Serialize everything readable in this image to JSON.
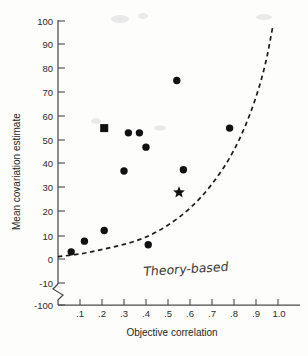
{
  "chart_data": {
    "type": "scatter",
    "title": "",
    "xlabel": "Objective correlation",
    "ylabel": "Mean covariation estimate",
    "xlim": [
      0.0,
      1.0
    ],
    "ylim": [
      -100,
      100
    ],
    "y_axis_break": true,
    "y_break_between": [
      -10,
      -100
    ],
    "grid": false,
    "legend": false,
    "xticks": [
      0.1,
      0.2,
      0.3,
      0.4,
      0.5,
      0.6,
      0.7,
      0.8,
      0.9,
      1.0
    ],
    "xticklabels": [
      ".1",
      ".2",
      ".3",
      ".4",
      ".5",
      ".6",
      ".7",
      ".8",
      ".9",
      "1.0"
    ],
    "yticks": [
      100,
      90,
      80,
      70,
      60,
      50,
      40,
      30,
      20,
      10,
      0,
      -10,
      -100
    ],
    "yticklabels": [
      "100",
      "90",
      "80",
      "70",
      "60",
      "50",
      "40",
      "30",
      "20",
      "10",
      "0",
      "-10",
      "-100"
    ],
    "series": [
      {
        "name": "circle-points",
        "marker": "circle",
        "color": "#111111",
        "points": [
          {
            "x": 0.06,
            "y": 3
          },
          {
            "x": 0.12,
            "y": 7.5
          },
          {
            "x": 0.21,
            "y": 12
          },
          {
            "x": 0.3,
            "y": 37
          },
          {
            "x": 0.32,
            "y": 53
          },
          {
            "x": 0.37,
            "y": 53
          },
          {
            "x": 0.4,
            "y": 47
          },
          {
            "x": 0.41,
            "y": 6
          },
          {
            "x": 0.54,
            "y": 75
          },
          {
            "x": 0.57,
            "y": 37.5
          },
          {
            "x": 0.78,
            "y": 55
          }
        ]
      },
      {
        "name": "square-point",
        "marker": "square",
        "color": "#111111",
        "points": [
          {
            "x": 0.21,
            "y": 55
          }
        ]
      },
      {
        "name": "star-point",
        "marker": "star",
        "color": "#111111",
        "points": [
          {
            "x": 0.55,
            "y": 28
          }
        ]
      }
    ],
    "curves": [
      {
        "name": "theory-based-curve",
        "style": "dashed",
        "color": "#1a1a1a",
        "label": "Theory-based",
        "points": [
          {
            "x": 0.0,
            "y": 1
          },
          {
            "x": 0.1,
            "y": 2
          },
          {
            "x": 0.2,
            "y": 4
          },
          {
            "x": 0.3,
            "y": 6
          },
          {
            "x": 0.4,
            "y": 9
          },
          {
            "x": 0.5,
            "y": 14
          },
          {
            "x": 0.6,
            "y": 21
          },
          {
            "x": 0.7,
            "y": 31
          },
          {
            "x": 0.8,
            "y": 45
          },
          {
            "x": 0.88,
            "y": 62
          },
          {
            "x": 0.94,
            "y": 80
          },
          {
            "x": 0.975,
            "y": 97
          }
        ]
      }
    ],
    "annotations": [
      {
        "name": "theory-based-label",
        "text": "Theory-based",
        "x": 0.46,
        "y": -8,
        "style": "handwritten"
      }
    ]
  },
  "axes": {
    "x_title": "Objective correlation",
    "y_title": "Mean covariation estimate",
    "x_tick_labels": [
      ".1",
      ".2",
      ".3",
      ".4",
      ".5",
      ".6",
      ".7",
      ".8",
      ".9",
      "1.0"
    ],
    "y_tick_labels": [
      "100",
      "90",
      "80",
      "70",
      "60",
      "50",
      "40",
      "30",
      "20",
      "10",
      "0",
      "-10",
      "-100"
    ]
  },
  "annotation": {
    "theory_based": "Theory-based"
  },
  "colors": {
    "marker": "#111111",
    "curve": "#1a1a1a",
    "axis": "#4a4a4a",
    "text": "#1f1f1f",
    "background": "#fdfdfc"
  }
}
